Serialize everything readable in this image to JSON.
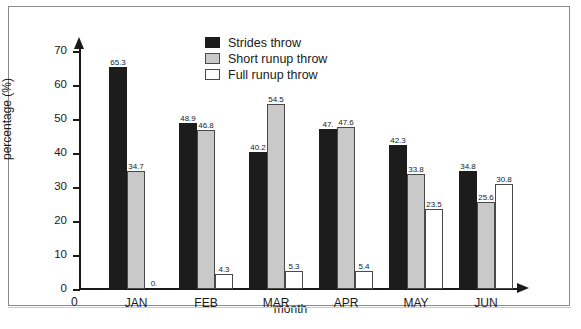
{
  "chart_data": {
    "type": "bar",
    "title": "",
    "xlabel": "month",
    "ylabel": "percentage (%)",
    "categories": [
      "JAN",
      "FEB",
      "MAR",
      "APR",
      "MAY",
      "JUN"
    ],
    "series": [
      {
        "name": "Strides throw",
        "color": "#1c1c1c",
        "values": [
          65.3,
          48.9,
          40.2,
          47.1,
          42.3,
          34.8
        ]
      },
      {
        "name": "Short runup throw",
        "color": "#c9c9c9",
        "values": [
          34.7,
          46.8,
          54.5,
          47.6,
          33.8,
          25.6
        ]
      },
      {
        "name": "Full runup throw",
        "color": "#ffffff",
        "values": [
          0.0,
          4.3,
          5.3,
          5.4,
          23.5,
          30.8
        ]
      }
    ],
    "value_labels": [
      [
        "65.3",
        "34.7",
        "0."
      ],
      [
        "48.9",
        "46.8",
        "4.3"
      ],
      [
        "40.2",
        "54.5",
        "5.3"
      ],
      [
        "47.",
        "47.6",
        "5.4"
      ],
      [
        "42.3",
        "33.8",
        "23.5"
      ],
      [
        "34.8",
        "25.6",
        "30.8"
      ]
    ],
    "ylim": [
      0,
      70
    ],
    "yticks": [
      0,
      10,
      20,
      30,
      40,
      50,
      60,
      70
    ],
    "ytick_labels": [
      "0",
      "10",
      "20",
      "30",
      "40",
      "50",
      "60",
      "70"
    ],
    "origin_label": "0",
    "grid": false,
    "legend_position": "top-center"
  },
  "legend": {
    "items": [
      {
        "label": "Strides throw"
      },
      {
        "label": "Short runup throw"
      },
      {
        "label": "Full runup throw"
      }
    ]
  },
  "axes": {
    "y_title": "percentage (%)",
    "x_title": "month",
    "origin": "0"
  }
}
